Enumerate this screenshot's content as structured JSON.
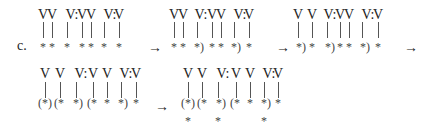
{
  "label": "c.",
  "arrow": "→",
  "blocks": [
    {
      "x0": 0,
      "y0": 0,
      "tops": [
        [
          "V",
          43
        ],
        [
          "V",
          52
        ],
        [
          "V:",
          69
        ],
        [
          "V",
          82
        ],
        [
          "V",
          91
        ],
        [
          "V:",
          107
        ],
        [
          "V",
          119
        ]
      ],
      "bars": [
        43,
        52,
        67,
        82,
        91,
        104,
        119
      ],
      "bottom": [
        [
          "*",
          43
        ],
        [
          "*",
          52
        ],
        [
          "*",
          67
        ],
        [
          "*",
          82
        ],
        [
          "*",
          91
        ],
        [
          "*",
          104
        ],
        [
          "*",
          119
        ]
      ],
      "extra": []
    },
    {
      "x0": 0,
      "y0": 0,
      "tops": [
        [
          "V",
          174
        ],
        [
          "V",
          183
        ],
        [
          "V:",
          198
        ],
        [
          "V",
          212
        ],
        [
          "V",
          221
        ],
        [
          "V:",
          237
        ],
        [
          "V",
          249
        ]
      ],
      "bars": [
        174,
        183,
        197,
        212,
        221,
        234,
        249
      ],
      "bottom": [
        [
          "*",
          174
        ],
        [
          "*",
          183
        ],
        [
          "*)",
          199
        ],
        [
          "*",
          212
        ],
        [
          "*",
          221
        ],
        [
          "*)",
          236
        ],
        [
          "*",
          249
        ]
      ],
      "extra": []
    },
    {
      "x0": 0,
      "y0": 0,
      "tops": [
        [
          "V",
          298
        ],
        [
          "V",
          312
        ],
        [
          "V:",
          327
        ],
        [
          "V",
          340
        ],
        [
          "V",
          349
        ],
        [
          "V:",
          365
        ],
        [
          "V",
          378
        ]
      ],
      "bars": [
        298,
        312,
        327,
        340,
        349,
        362,
        378
      ],
      "bottom": [
        [
          "*)",
          301
        ],
        [
          "*",
          312
        ],
        [
          "*)",
          330
        ],
        [
          "*",
          340
        ],
        [
          "*",
          349
        ],
        [
          "*)",
          365
        ],
        [
          "*",
          378
        ]
      ],
      "extra": []
    },
    {
      "x0": 0,
      "y0": 0,
      "tops": [
        [
          "V",
          45
        ],
        [
          "V",
          60
        ],
        [
          "V:",
          78
        ],
        [
          "V",
          93
        ],
        [
          "V",
          107
        ],
        [
          "V:",
          123
        ],
        [
          "V",
          136
        ]
      ],
      "bars": [
        45,
        60,
        76,
        93,
        107,
        121,
        136
      ],
      "bottom": [
        [
          "(*)",
          45
        ],
        [
          "(*",
          59
        ],
        [
          "*)",
          78
        ],
        [
          "(*",
          92
        ],
        [
          "*",
          107
        ],
        [
          "*)",
          123
        ],
        [
          "*",
          136
        ]
      ],
      "extra": []
    },
    {
      "x0": 0,
      "y0": 0,
      "tops": [
        [
          "V",
          188
        ],
        [
          "V",
          202
        ],
        [
          "V:",
          220
        ],
        [
          "V",
          236
        ],
        [
          "V",
          250
        ],
        [
          "V:",
          266
        ],
        [
          "V",
          278
        ]
      ],
      "bars": [
        188,
        202,
        218,
        236,
        250,
        264,
        278
      ],
      "bottom": [
        [
          "(*)",
          188
        ],
        [
          "(*",
          202
        ],
        [
          "*)",
          221
        ],
        [
          "(*",
          235
        ],
        [
          "*",
          250
        ],
        [
          "*)",
          266
        ],
        [
          "*",
          278
        ]
      ],
      "extra": [
        [
          "*",
          188
        ],
        [
          "*",
          218
        ],
        [
          "*",
          264
        ]
      ]
    }
  ],
  "arrows": [
    [
      148,
      41
    ],
    [
      276,
      41
    ],
    [
      404,
      41
    ],
    [
      155,
      100
    ]
  ]
}
